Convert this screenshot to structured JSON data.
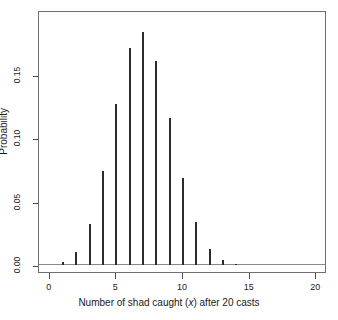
{
  "chart_data": {
    "type": "bar",
    "title": "",
    "subtitle": "",
    "xlabel_prefix": "Number of shad caught (",
    "xlabel_var": "x",
    "xlabel_suffix": ") after 20 casts",
    "xlabel": "Number of shad caught (x) after 20 casts",
    "ylabel": "Probability",
    "categories": [
      0,
      1,
      2,
      3,
      4,
      5,
      6,
      7,
      8,
      9,
      10,
      11,
      12,
      13,
      14,
      15,
      16,
      17,
      18,
      19,
      20
    ],
    "values": [
      0.0002,
      0.002,
      0.01,
      0.032,
      0.074,
      0.127,
      0.171,
      0.184,
      0.161,
      0.116,
      0.069,
      0.034,
      0.013,
      0.004,
      0.001,
      0.0002,
      0.0,
      0.0,
      0.0,
      0.0,
      0.0
    ],
    "xlim": [
      -0.8,
      20.8
    ],
    "ylim": [
      0.0,
      0.1895
    ],
    "x_ticks": [
      0,
      5,
      10,
      15,
      20
    ],
    "x_tick_labels": [
      "0",
      "5",
      "10",
      "15",
      "20"
    ],
    "y_ticks": [
      0.0,
      0.05,
      0.1,
      0.15
    ],
    "y_tick_labels": [
      "0.00",
      "0.05",
      "0.10",
      "0.15"
    ],
    "grid": false,
    "legend": false,
    "legend_position": "none",
    "bar_color": "#2b2b2b",
    "axis_color": "#6e6e6e",
    "baseline_color": "#8a8a8a",
    "background_color": "#ffffff",
    "annotations": []
  }
}
